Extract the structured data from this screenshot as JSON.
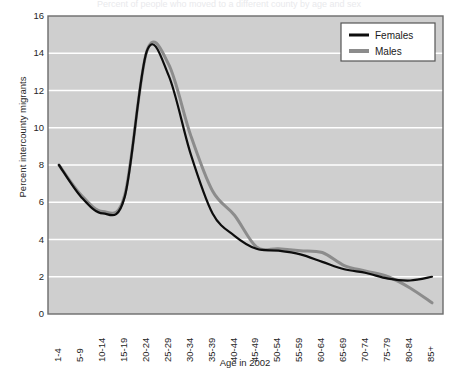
{
  "title_cut": "Percent of people who moved to a different county by age and sex",
  "axes": {
    "ylabel": "Percent intercounty migrants",
    "xlabel": "Age in 2002",
    "yticks": [
      "0",
      "2",
      "4",
      "6",
      "8",
      "10",
      "12",
      "14",
      "16"
    ],
    "ymin": 0,
    "ymax": 16
  },
  "legend": {
    "position": "top-right",
    "items": [
      {
        "label": "Females",
        "color": "#0d0d0d"
      },
      {
        "label": "Males",
        "color": "#8c8c8c"
      }
    ]
  },
  "colors": {
    "plot_background": "#cfcfcf",
    "gridline": "#ffffff",
    "axis_border": "#6b6b6b",
    "females_line": "#0d0d0d",
    "males_line": "#8c8c8c",
    "page_background": "#ffffff"
  },
  "chart_data": {
    "type": "line",
    "title": "Percent of people who moved to a different county by age and sex",
    "xlabel": "Age in 2002",
    "ylabel": "Percent intercounty migrants",
    "ylim": [
      0,
      16
    ],
    "grid": true,
    "legend_position": "top-right",
    "categories": [
      "1-4",
      "5-9",
      "10-14",
      "15-19",
      "20-24",
      "25-29",
      "30-34",
      "35-39",
      "40-44",
      "45-49",
      "50-54",
      "55-59",
      "60-64",
      "65-69",
      "70-74",
      "75-79",
      "80-84",
      "85+"
    ],
    "series": [
      {
        "name": "Females",
        "color": "#0d0d0d",
        "values": [
          8.0,
          6.3,
          5.4,
          6.3,
          14.1,
          12.8,
          8.6,
          5.4,
          4.2,
          3.5,
          3.4,
          3.2,
          2.8,
          2.4,
          2.2,
          1.9,
          1.8,
          2.0
        ]
      },
      {
        "name": "Males",
        "color": "#8c8c8c",
        "values": [
          8.0,
          6.4,
          5.5,
          6.4,
          14.1,
          13.4,
          9.6,
          6.6,
          5.3,
          3.6,
          3.5,
          3.4,
          3.3,
          2.6,
          2.3,
          2.0,
          1.4,
          0.6
        ]
      }
    ]
  }
}
